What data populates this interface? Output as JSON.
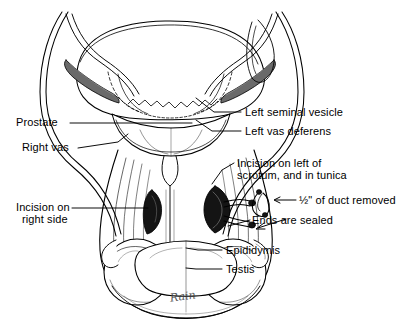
{
  "figure": {
    "ink_color": "#000000",
    "background_color": "#ffffff",
    "shade_color": "#555555",
    "signature": "Rain"
  },
  "labels": [
    {
      "id": "prostate",
      "text": "Prostate",
      "x": 16,
      "y": 118,
      "leader": true
    },
    {
      "id": "right-vas",
      "text": "Right vas",
      "x": 22,
      "y": 143,
      "leader": true
    },
    {
      "id": "incision-right",
      "text": "Incision on",
      "x": 16,
      "y": 203,
      "leader": true
    },
    {
      "id": "incision-right-2",
      "text": "right side",
      "x": 22,
      "y": 215,
      "leader": false
    },
    {
      "id": "left-seminal-vesicle",
      "text": "Left seminal vesicle",
      "x": 243,
      "y": 107,
      "leader": true
    },
    {
      "id": "left-vas-deferens",
      "text": "Left vas deferens",
      "x": 243,
      "y": 126,
      "leader": true
    },
    {
      "id": "incision-left-1",
      "text": "Incision on left of",
      "x": 237,
      "y": 158,
      "leader": true
    },
    {
      "id": "incision-left-2",
      "text": "scrotum, and in tunica",
      "x": 237,
      "y": 170,
      "leader": false
    },
    {
      "id": "duct-removed",
      "text": "½\" of duct removed",
      "x": 268,
      "y": 192,
      "leader": false
    },
    {
      "id": "ends-sealed",
      "text": "Ends are sealed",
      "x": 252,
      "y": 215,
      "leader": true
    },
    {
      "id": "epididymis",
      "text": "Epididymis",
      "x": 224,
      "y": 245,
      "leader": true
    },
    {
      "id": "testis",
      "text": "Testis",
      "x": 224,
      "y": 264,
      "leader": true
    }
  ],
  "anatomy_parts": [
    "bladder",
    "prostate",
    "left-seminal-vesicle",
    "right-seminal-vesicle",
    "left-vas-deferens",
    "right-vas-deferens",
    "urethra",
    "scrotum",
    "left-testis",
    "right-testis",
    "epididymis",
    "incision-left-site",
    "incision-right-site",
    "excised-duct-segment"
  ],
  "annotations": {
    "arrow_to_duct_segment": "←",
    "arrow_to_sealed_ends": "←"
  }
}
